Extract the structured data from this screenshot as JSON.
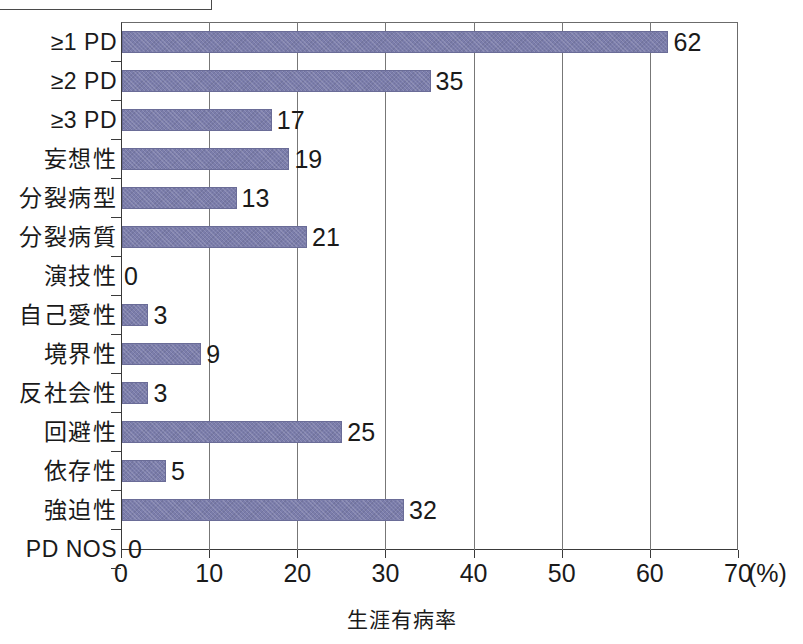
{
  "figure": {
    "top_fragment_note": "",
    "background_color": "#ffffff",
    "bar_color": "#7b7dab",
    "axis_color": "#3a3a3a",
    "grid_color": "#777777"
  },
  "chart_data": {
    "type": "bar",
    "orientation": "horizontal",
    "title": "",
    "xlabel": "生涯有病率",
    "ylabel": "",
    "unit": "(%)",
    "xlim": [
      0,
      70
    ],
    "xticks": [
      0,
      10,
      20,
      30,
      40,
      50,
      60,
      70
    ],
    "xtick_labels": [
      "0",
      "10",
      "20",
      "30",
      "40",
      "50",
      "60",
      "70"
    ],
    "grid": "vertical",
    "legend": "none",
    "categories": [
      "≥1 PD",
      "≥2 PD",
      "≥3 PD",
      "妄想性",
      "分裂病型",
      "分裂病質",
      "演技性",
      "自己愛性",
      "境界性",
      "反社会性",
      "回避性",
      "依存性",
      "強迫性",
      "PD NOS"
    ],
    "values": [
      62,
      35,
      17,
      19,
      13,
      21,
      0,
      3,
      9,
      3,
      25,
      5,
      32,
      0
    ],
    "data_labels": [
      "62",
      "35",
      "17",
      "19",
      "13",
      "21",
      "0",
      "3",
      "9",
      "3",
      "25",
      "5",
      "32",
      "0"
    ],
    "series": [
      {
        "name": "生涯有病率",
        "values": [
          62,
          35,
          17,
          19,
          13,
          21,
          0,
          3,
          9,
          3,
          25,
          5,
          32,
          0
        ]
      }
    ]
  }
}
